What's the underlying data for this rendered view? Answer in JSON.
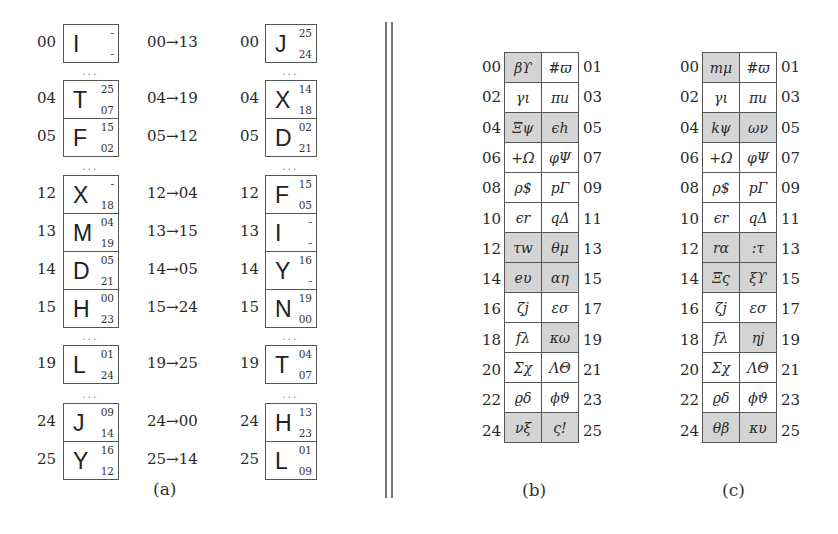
{
  "panel_a": {
    "caption": "(a)",
    "ellipsis": "...",
    "left_column": [
      {
        "index": "00",
        "letter": "I",
        "top": "-",
        "bottom": "-"
      },
      {
        "index": "04",
        "letter": "T",
        "top": "25",
        "bottom": "07"
      },
      {
        "index": "05",
        "letter": "F",
        "top": "15",
        "bottom": "02"
      },
      {
        "index": "12",
        "letter": "X",
        "top": "-",
        "bottom": "18"
      },
      {
        "index": "13",
        "letter": "M",
        "top": "04",
        "bottom": "19"
      },
      {
        "index": "14",
        "letter": "D",
        "top": "05",
        "bottom": "21"
      },
      {
        "index": "15",
        "letter": "H",
        "top": "00",
        "bottom": "23"
      },
      {
        "index": "19",
        "letter": "L",
        "top": "01",
        "bottom": "24"
      },
      {
        "index": "24",
        "letter": "J",
        "top": "09",
        "bottom": "14"
      },
      {
        "index": "25",
        "letter": "Y",
        "top": "16",
        "bottom": "12"
      }
    ],
    "mappings": [
      "00→13",
      "04→19",
      "05→12",
      "12→04",
      "13→15",
      "14→05",
      "15→24",
      "19→25",
      "24→00",
      "25→14"
    ],
    "right_column": [
      {
        "index": "00",
        "letter": "J",
        "top": "25",
        "bottom": "24"
      },
      {
        "index": "04",
        "letter": "X",
        "top": "14",
        "bottom": "18"
      },
      {
        "index": "05",
        "letter": "D",
        "top": "02",
        "bottom": "21"
      },
      {
        "index": "12",
        "letter": "F",
        "top": "15",
        "bottom": "05"
      },
      {
        "index": "13",
        "letter": "I",
        "top": "-",
        "bottom": "-"
      },
      {
        "index": "14",
        "letter": "Y",
        "top": "16",
        "bottom": "-"
      },
      {
        "index": "15",
        "letter": "N",
        "top": "19",
        "bottom": "00"
      },
      {
        "index": "19",
        "letter": "T",
        "top": "04",
        "bottom": "07"
      },
      {
        "index": "24",
        "letter": "H",
        "top": "13",
        "bottom": "23"
      },
      {
        "index": "25",
        "letter": "L",
        "top": "01",
        "bottom": "09"
      }
    ]
  },
  "panel_b": {
    "caption": "(b)",
    "rows": [
      {
        "left_label": "00",
        "right_label": "01",
        "cells": [
          {
            "text": "βϒ",
            "shaded": true
          },
          {
            "text": "#ϖ",
            "shaded": false
          }
        ]
      },
      {
        "left_label": "02",
        "right_label": "03",
        "cells": [
          {
            "text": "γι",
            "shaded": false
          },
          {
            "text": "πu",
            "shaded": false
          }
        ]
      },
      {
        "left_label": "04",
        "right_label": "05",
        "cells": [
          {
            "text": "Ξψ",
            "shaded": true
          },
          {
            "text": "ϵh",
            "shaded": true
          }
        ]
      },
      {
        "left_label": "06",
        "right_label": "07",
        "cells": [
          {
            "text": "+Ω",
            "shaded": false
          },
          {
            "text": "φΨ",
            "shaded": false
          }
        ]
      },
      {
        "left_label": "08",
        "right_label": "09",
        "cells": [
          {
            "text": "ρ$",
            "shaded": false
          },
          {
            "text": "pΓ",
            "shaded": false
          }
        ]
      },
      {
        "left_label": "10",
        "right_label": "11",
        "cells": [
          {
            "text": "ϵr",
            "shaded": false
          },
          {
            "text": "qΔ",
            "shaded": false
          }
        ]
      },
      {
        "left_label": "12",
        "right_label": "13",
        "cells": [
          {
            "text": "τw",
            "shaded": true
          },
          {
            "text": "θμ",
            "shaded": true
          }
        ]
      },
      {
        "left_label": "14",
        "right_label": "15",
        "cells": [
          {
            "text": "eυ",
            "shaded": true
          },
          {
            "text": "αη",
            "shaded": true
          }
        ]
      },
      {
        "left_label": "16",
        "right_label": "17",
        "cells": [
          {
            "text": "ζj",
            "shaded": false
          },
          {
            "text": "εσ",
            "shaded": false
          }
        ]
      },
      {
        "left_label": "18",
        "right_label": "19",
        "cells": [
          {
            "text": "fλ",
            "shaded": false
          },
          {
            "text": "κω",
            "shaded": true
          }
        ]
      },
      {
        "left_label": "20",
        "right_label": "21",
        "cells": [
          {
            "text": "Σχ",
            "shaded": false
          },
          {
            "text": "ΛΘ",
            "shaded": false
          }
        ]
      },
      {
        "left_label": "22",
        "right_label": "23",
        "cells": [
          {
            "text": "ϱδ",
            "shaded": false
          },
          {
            "text": "ϕϑ",
            "shaded": false
          }
        ]
      },
      {
        "left_label": "24",
        "right_label": "25",
        "cells": [
          {
            "text": "νξ",
            "shaded": true
          },
          {
            "text": "ς!",
            "shaded": true
          }
        ]
      }
    ]
  },
  "panel_c": {
    "caption": "(c)",
    "rows": [
      {
        "left_label": "00",
        "right_label": "01",
        "cells": [
          {
            "text": "mμ",
            "shaded": true
          },
          {
            "text": "#ϖ",
            "shaded": false
          }
        ]
      },
      {
        "left_label": "02",
        "right_label": "03",
        "cells": [
          {
            "text": "γι",
            "shaded": false
          },
          {
            "text": "πu",
            "shaded": false
          }
        ]
      },
      {
        "left_label": "04",
        "right_label": "05",
        "cells": [
          {
            "text": "kψ",
            "shaded": true
          },
          {
            "text": "ων",
            "shaded": true
          }
        ]
      },
      {
        "left_label": "06",
        "right_label": "07",
        "cells": [
          {
            "text": "+Ω",
            "shaded": false
          },
          {
            "text": "φΨ",
            "shaded": false
          }
        ]
      },
      {
        "left_label": "08",
        "right_label": "09",
        "cells": [
          {
            "text": "ρ$",
            "shaded": false
          },
          {
            "text": "pΓ",
            "shaded": false
          }
        ]
      },
      {
        "left_label": "10",
        "right_label": "11",
        "cells": [
          {
            "text": "ϵr",
            "shaded": false
          },
          {
            "text": "qΔ",
            "shaded": false
          }
        ]
      },
      {
        "left_label": "12",
        "right_label": "13",
        "cells": [
          {
            "text": "rα",
            "shaded": true
          },
          {
            "text": ":τ",
            "shaded": true
          }
        ]
      },
      {
        "left_label": "14",
        "right_label": "15",
        "cells": [
          {
            "text": "Ξς",
            "shaded": true
          },
          {
            "text": "ξϒ",
            "shaded": true
          }
        ]
      },
      {
        "left_label": "16",
        "right_label": "17",
        "cells": [
          {
            "text": "ζj",
            "shaded": false
          },
          {
            "text": "εσ",
            "shaded": false
          }
        ]
      },
      {
        "left_label": "18",
        "right_label": "19",
        "cells": [
          {
            "text": "fλ",
            "shaded": false
          },
          {
            "text": "ηj",
            "shaded": true
          }
        ]
      },
      {
        "left_label": "20",
        "right_label": "21",
        "cells": [
          {
            "text": "Σχ",
            "shaded": false
          },
          {
            "text": "ΛΘ",
            "shaded": false
          }
        ]
      },
      {
        "left_label": "22",
        "right_label": "23",
        "cells": [
          {
            "text": "ϱδ",
            "shaded": false
          },
          {
            "text": "ϕϑ",
            "shaded": false
          }
        ]
      },
      {
        "left_label": "24",
        "right_label": "25",
        "cells": [
          {
            "text": "θβ",
            "shaded": true
          },
          {
            "text": "κυ",
            "shaded": true
          }
        ]
      }
    ]
  }
}
